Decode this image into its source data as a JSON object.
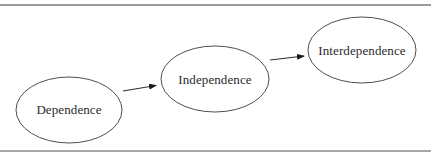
{
  "diagram": {
    "type": "flow",
    "colors": {
      "stroke": "#3a3a3a",
      "rule": "#7a7a7a",
      "text": "#2a2a2a",
      "background": "#ffffff"
    },
    "nodes": [
      {
        "id": "dependence",
        "label": "Dependence",
        "cx": 69,
        "cy": 110,
        "rx": 53,
        "ry": 33
      },
      {
        "id": "independence",
        "label": "Independence",
        "cx": 215,
        "cy": 79,
        "rx": 54,
        "ry": 33
      },
      {
        "id": "interdependence",
        "label": "Interdependence",
        "cx": 362,
        "cy": 50,
        "rx": 54,
        "ry": 33
      }
    ],
    "edges": [
      {
        "from": "dependence",
        "to": "independence"
      },
      {
        "from": "independence",
        "to": "interdependence"
      }
    ]
  }
}
